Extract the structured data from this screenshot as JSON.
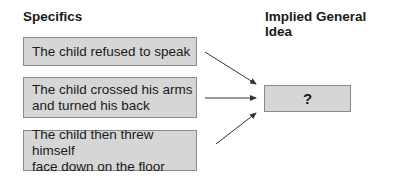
{
  "headings": {
    "left": "Specifics",
    "right": "Implied General Idea"
  },
  "specifics": [
    {
      "line1": "The child refused to speak",
      "line2": ""
    },
    {
      "line1": "The child crossed his arms",
      "line2": "and turned his back"
    },
    {
      "line1": "The child then threw himself",
      "line2": "face down on the floor"
    }
  ],
  "general_idea": {
    "label": "?"
  },
  "colors": {
    "box_fill": "#d6d6d6",
    "box_border": "#8a8a8a",
    "arrow": "#333333"
  }
}
